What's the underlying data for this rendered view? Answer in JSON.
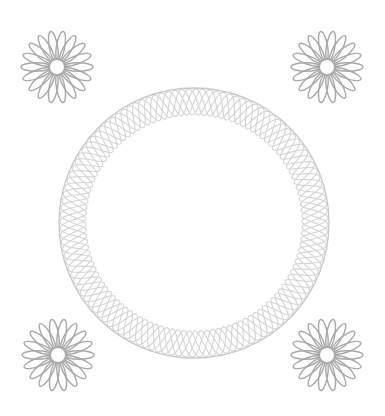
{
  "canvas": {
    "width": 385,
    "height": 416,
    "background": "#ffffff"
  },
  "flowers": [
    {
      "name": "top-left",
      "cx": 57,
      "cy": 67,
      "outer_r": 34,
      "inner_r": 8,
      "petals": 18,
      "color": "#a8a8a8",
      "stroke_width": 1.4
    },
    {
      "name": "top-right",
      "cx": 327,
      "cy": 67,
      "outer_r": 34,
      "inner_r": 8,
      "petals": 18,
      "color": "#a8a8a8",
      "stroke_width": 1.4
    },
    {
      "name": "bottom-left",
      "cx": 58,
      "cy": 355,
      "outer_r": 34,
      "inner_r": 8,
      "petals": 18,
      "color": "#a8a8a8",
      "stroke_width": 1.4
    },
    {
      "name": "bottom-right",
      "cx": 327,
      "cy": 355,
      "outer_r": 34,
      "inner_r": 8,
      "petals": 18,
      "color": "#a8a8a8",
      "stroke_width": 1.4
    }
  ],
  "ring": {
    "cx": 194,
    "cy": 223,
    "mid_r": 121,
    "amplitude": 13,
    "waves": 24,
    "strands": 5,
    "color": "#d4d4d4",
    "outer_color": "#c8c8c8",
    "stroke_width": 1.1
  }
}
